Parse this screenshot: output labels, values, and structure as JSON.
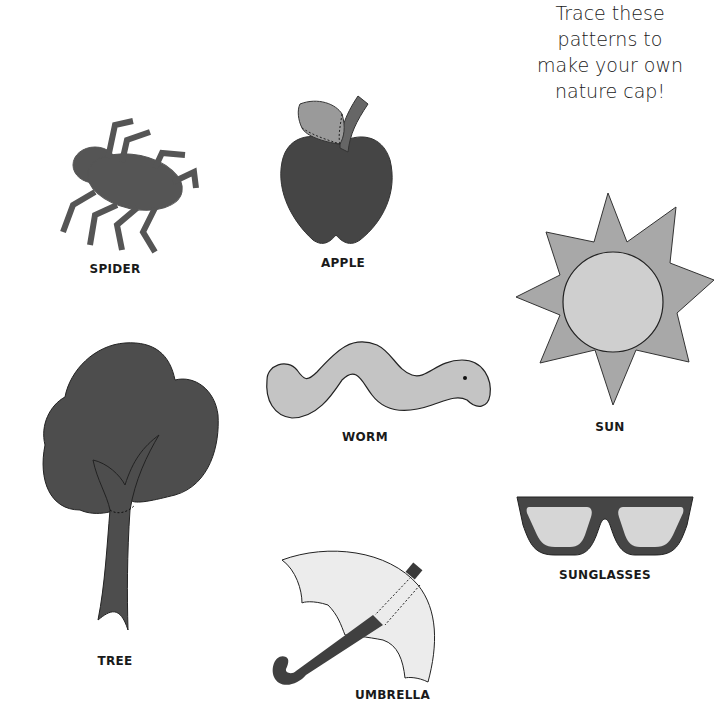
{
  "title": {
    "lines": [
      "Trace these",
      "patterns to",
      "make your own",
      "nature cap!"
    ]
  },
  "shapes": [
    {
      "id": "spider",
      "label": "SPIDER",
      "fill": "#555555"
    },
    {
      "id": "apple",
      "label": "APPLE",
      "fill": "#454545",
      "leaf_fill": "#9a9a9a",
      "stem_fill": "#666666"
    },
    {
      "id": "sun",
      "label": "SUN",
      "ray_fill": "#a8a8a8",
      "center_fill": "#cfcfcf"
    },
    {
      "id": "worm",
      "label": "WORM",
      "fill": "#c4c4c4"
    },
    {
      "id": "tree",
      "label": "TREE",
      "fill": "#4d4d4d"
    },
    {
      "id": "sunglasses",
      "label": "SUNGLASSES",
      "frame_fill": "#454545",
      "lens_fill": "#d6d6d6"
    },
    {
      "id": "umbrella",
      "label": "UMBRELLA",
      "canopy_fill": "#ececec",
      "handle_fill": "#404040"
    }
  ]
}
